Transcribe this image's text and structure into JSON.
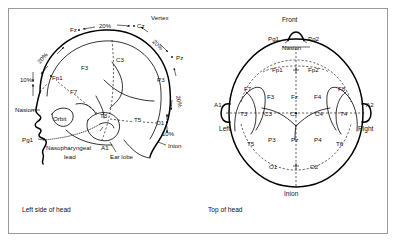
{
  "figure": {
    "captions": {
      "left": "Left side of head",
      "right": "Top of head"
    }
  },
  "left_view": {
    "name": "Left side of head",
    "anatomical_labels": [
      {
        "id": "vertex",
        "text": "Vertex"
      },
      {
        "id": "nasion",
        "text": "Nasion"
      },
      {
        "id": "orbit",
        "text": "Orbit"
      },
      {
        "id": "inion",
        "text": "Inion"
      },
      {
        "id": "earlobe",
        "text": "Ear lobe"
      },
      {
        "id": "nasopharyngeal",
        "text": "Nasopharyngeal"
      },
      {
        "id": "nasopharyngeal2",
        "text": "lead"
      }
    ],
    "percent_labels": [
      {
        "id": "pct-nasion-fp1",
        "text": "10%"
      },
      {
        "id": "pct-fp1-f3",
        "text": "20%"
      },
      {
        "id": "pct-fz-cz",
        "text": "20%"
      },
      {
        "id": "pct-cz-pz",
        "text": "20%"
      },
      {
        "id": "pct-pz-o1",
        "text": "20%"
      },
      {
        "id": "pct-o1-inion",
        "text": "10%"
      }
    ],
    "electrodes": [
      {
        "id": "Fz",
        "text": "Fz"
      },
      {
        "id": "Cz",
        "text": "Cz"
      },
      {
        "id": "Pz",
        "text": "Pz"
      },
      {
        "id": "F3",
        "text": "F3"
      },
      {
        "id": "C3",
        "text": "C3"
      },
      {
        "id": "P3",
        "text": "P3"
      },
      {
        "id": "Fp1",
        "text": "Fp1"
      },
      {
        "id": "F7",
        "text": "F7"
      },
      {
        "id": "T3",
        "text": "T3"
      },
      {
        "id": "T5",
        "text": "T5"
      },
      {
        "id": "O1",
        "text": "O1"
      },
      {
        "id": "A1",
        "text": "A1"
      },
      {
        "id": "Pg1",
        "text": "Pg1"
      }
    ]
  },
  "top_view": {
    "name": "Top of head",
    "orientation_labels": [
      {
        "id": "front",
        "text": "Front"
      },
      {
        "id": "left",
        "text": "Left"
      },
      {
        "id": "right",
        "text": "Right"
      },
      {
        "id": "nasion",
        "text": "Nasion"
      },
      {
        "id": "inion",
        "text": "Inion"
      }
    ],
    "electrodes": [
      {
        "id": "Pg1",
        "text": "Pg1"
      },
      {
        "id": "Pg2",
        "text": "Pg2"
      },
      {
        "id": "Fp1",
        "text": "Fp1"
      },
      {
        "id": "Fp2",
        "text": "Fp2"
      },
      {
        "id": "F7",
        "text": "F7"
      },
      {
        "id": "F3",
        "text": "F3"
      },
      {
        "id": "Fz",
        "text": "Fz"
      },
      {
        "id": "F4",
        "text": "F4"
      },
      {
        "id": "F8",
        "text": "F8"
      },
      {
        "id": "A1",
        "text": "A1"
      },
      {
        "id": "T3",
        "text": "T3"
      },
      {
        "id": "C3",
        "text": "C3"
      },
      {
        "id": "Cz",
        "text": "Cz"
      },
      {
        "id": "C4",
        "text": "C4"
      },
      {
        "id": "T4",
        "text": "T4"
      },
      {
        "id": "A2",
        "text": "A2"
      },
      {
        "id": "T5",
        "text": "T5"
      },
      {
        "id": "P3",
        "text": "P3"
      },
      {
        "id": "Pz",
        "text": "Pz"
      },
      {
        "id": "P4",
        "text": "P4"
      },
      {
        "id": "T6",
        "text": "T6"
      },
      {
        "id": "O1",
        "text": "O1"
      },
      {
        "id": "O2",
        "text": "O2"
      }
    ]
  },
  "colors": {
    "ink": "#111111",
    "frame": "#9a9a9a",
    "background": "#ffffff"
  }
}
